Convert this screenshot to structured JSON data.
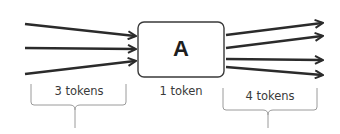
{
  "diagram": {
    "node": {
      "label": "A",
      "caption": "1 token"
    },
    "inputs": {
      "count": 3,
      "caption": "3 tokens"
    },
    "outputs": {
      "count": 4,
      "caption": "4 tokens"
    },
    "colors": {
      "arrow": "#2b2b2b",
      "box_stroke": "#3a3a3a",
      "brace": "#9a9a9a",
      "text": "#3a3a3a"
    }
  }
}
